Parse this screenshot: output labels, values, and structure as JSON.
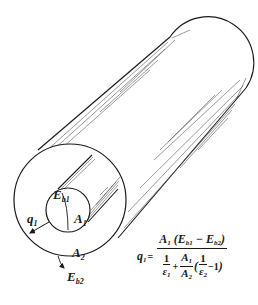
{
  "figure": {
    "colors": {
      "line": "#1a1a1a",
      "hatch": "#555555",
      "background": "#ffffff"
    },
    "geometry": {
      "outer_circle": {
        "cx": 70,
        "cy": 200,
        "r": 56
      },
      "inner_circle": {
        "cx": 68,
        "cy": 210,
        "r": 22
      },
      "far_end_cap": {
        "cx": 203,
        "cy": 72,
        "r": 45
      }
    }
  },
  "labels": {
    "q1": {
      "sym": "q",
      "sub": "1"
    },
    "Eb1": {
      "sym": "E",
      "sub": "b1"
    },
    "A1": {
      "sym": "A",
      "sub": "1"
    },
    "A2": {
      "sym": "A",
      "sub": "2"
    },
    "Eb2": {
      "sym": "E",
      "sub": "b2"
    }
  },
  "equation": {
    "lhs": {
      "sym": "q",
      "sub": "1"
    },
    "equals": "=",
    "numerator": {
      "A": "A",
      "A_sub": "1",
      "open": "(",
      "E1": "E",
      "E1_sub": "b1",
      "minus": "−",
      "E2": "E",
      "E2_sub": "b2",
      "close": ")"
    },
    "denominator": {
      "t1_num": "1",
      "t1_den": "ε",
      "t1_den_sub": "1",
      "plus": "+",
      "t2_num": "A",
      "t2_num_sub": "1",
      "t2_den": "A",
      "t2_den_sub": "2",
      "open": "(",
      "t3_num": "1",
      "t3_den": "ε",
      "t3_den_sub": "2",
      "minus_one": "−1",
      "close": ")"
    }
  }
}
